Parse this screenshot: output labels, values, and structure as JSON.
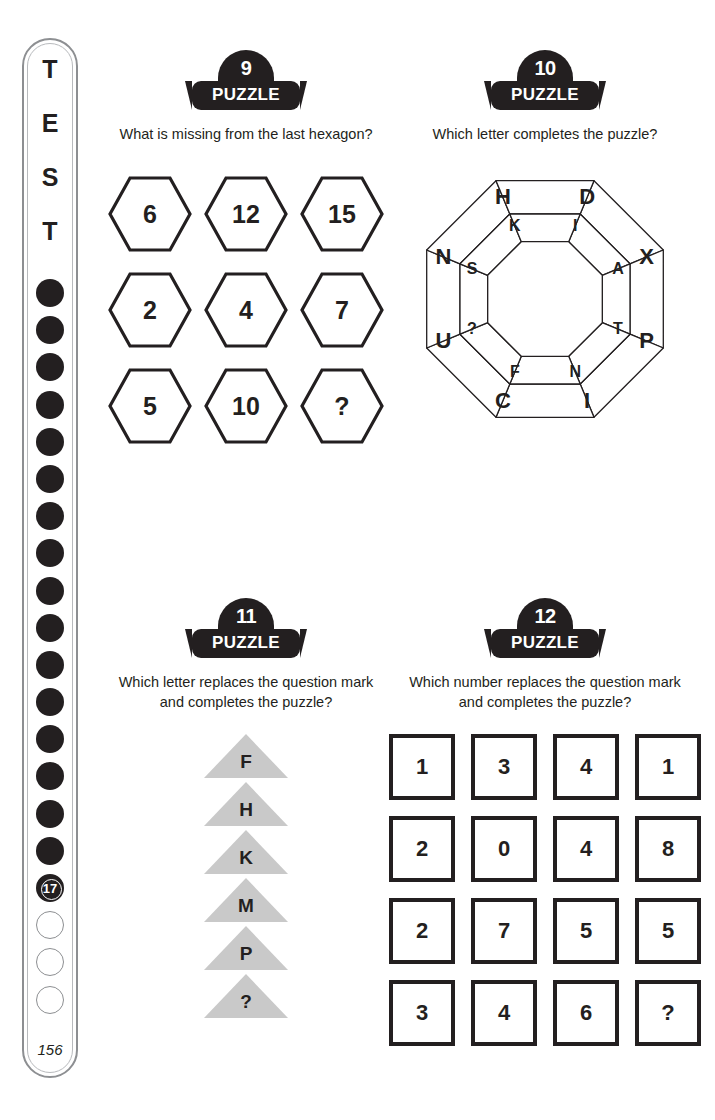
{
  "rail": {
    "letters": [
      "T",
      "E",
      "S",
      "T"
    ],
    "filled_dot_count": 16,
    "current_marker": "17",
    "empty_dot_count": 3,
    "page_number": "156"
  },
  "puzzles": [
    {
      "id": "puzzle-9",
      "badge_number": "9",
      "badge_word": "PUZZLE",
      "question": "What is missing from the last hexagon?",
      "type": "hexagon-grid",
      "cells": [
        "6",
        "12",
        "15",
        "2",
        "4",
        "7",
        "5",
        "10",
        "?"
      ]
    },
    {
      "id": "puzzle-10",
      "badge_number": "10",
      "badge_word": "PUZZLE",
      "question": "Which letter completes the puzzle?",
      "type": "octagon-ring",
      "outer_ring": [
        "H",
        "D",
        "X",
        "P",
        "I",
        "C",
        "U",
        "N"
      ],
      "inner_ring": [
        "K",
        "I",
        "A",
        "T",
        "N",
        "F",
        "?",
        "S"
      ]
    },
    {
      "id": "puzzle-11",
      "badge_number": "11",
      "badge_word": "PUZZLE",
      "question": "Which letter replaces the question mark and completes the puzzle?",
      "question_line1": "Which letter replaces the question mark",
      "question_line2": "and completes the puzzle?",
      "type": "triangle-stack",
      "cells": [
        "F",
        "H",
        "K",
        "M",
        "P",
        "?"
      ],
      "shape_fill": "#c9c9c9"
    },
    {
      "id": "puzzle-12",
      "badge_number": "12",
      "badge_word": "PUZZLE",
      "question": "Which number replaces the question mark and completes the puzzle?",
      "question_line1": "Which number replaces the question mark",
      "question_line2": "and completes the puzzle?",
      "type": "number-grid",
      "rows": [
        [
          "1",
          "3",
          "4",
          "1"
        ],
        [
          "2",
          "0",
          "4",
          "8"
        ],
        [
          "2",
          "7",
          "5",
          "5"
        ],
        [
          "3",
          "4",
          "6",
          "?"
        ]
      ]
    }
  ],
  "colors": {
    "ink": "#231f20",
    "rail_border": "#8d8f92",
    "triangle_gray": "#c9c9c9"
  }
}
